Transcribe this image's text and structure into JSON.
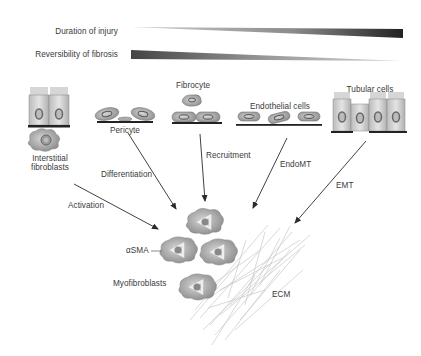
{
  "gradients": {
    "duration": {
      "label": "Duration of injury",
      "direction": "increasing"
    },
    "reversibility": {
      "label": "Reversibility of fibrosis",
      "direction": "decreasing"
    }
  },
  "sources": {
    "interstitial_fibroblasts": {
      "label_line1": "Interstitial",
      "label_line2": "fibroblasts",
      "process": "Activation"
    },
    "pericyte": {
      "label": "Pericyte",
      "process": "Differentiation"
    },
    "fibrocyte": {
      "label": "Fibrocyte",
      "process": "Recruitment"
    },
    "endothelial": {
      "label": "Endothelial cells",
      "process": "EndoMT"
    },
    "tubular": {
      "label": "Tubular cells",
      "process": "EMT"
    }
  },
  "targets": {
    "asma": "αSMA",
    "myofibroblasts": "Myofibroblasts",
    "ecm": "ECM"
  },
  "colors": {
    "text": "#3a3a3a",
    "arrow": "#2b2b2b",
    "cell_fill": "#b9b9b9",
    "cell_dark": "#8a8a8a",
    "membrane": "#222222",
    "ecm_fibers": "#c8c8c8"
  }
}
